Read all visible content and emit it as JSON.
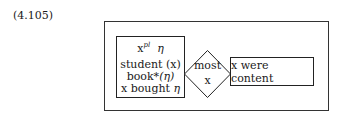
{
  "equation_label": "(4.105)",
  "drs": {
    "restrictor": {
      "discourse_referent": "x",
      "plural_marker": "pl",
      "eta": "η",
      "conditions": [
        {
          "pred": "student",
          "arg": "(x)"
        },
        {
          "pred": "book*",
          "arg": "(η)"
        },
        {
          "pred": "x bought",
          "arg": "η"
        }
      ]
    },
    "quantifier": {
      "label": "most",
      "var": "x"
    },
    "scope": {
      "condition": "x were content"
    }
  }
}
